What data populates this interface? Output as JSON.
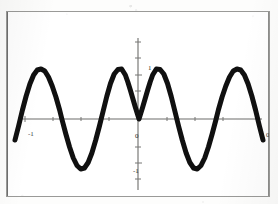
{
  "figure": {
    "kind": "scanned-plot",
    "background_color": "#fdfdfc",
    "frame_color": "#9a9a98",
    "curve_color": "#101010",
    "axis_color": "#6d6d6b"
  },
  "labels": {
    "y_positive": "1",
    "y_negative": "-1",
    "origin": "0",
    "x_left": "-1",
    "x_right": "0"
  },
  "chart_data": {
    "type": "line",
    "title": "",
    "subtitle": "",
    "xlabel": "",
    "ylabel": "",
    "xlim": [
      -1,
      1
    ],
    "ylim": [
      -1.35,
      1.35
    ],
    "grid": false,
    "legend": null,
    "axis_ticks": {
      "x": [
        -1,
        0,
        1
      ],
      "x_tick_labels": [
        "-1",
        "0",
        "0"
      ],
      "y": [
        -1,
        0,
        1
      ],
      "y_tick_labels": [
        "-1",
        "0",
        "1"
      ]
    },
    "line_width_px": 5,
    "line_style": "solid",
    "features": {
      "maxima_x": [
        -0.62,
        -0.14,
        0.15,
        0.62
      ],
      "maxima_y": [
        1,
        1,
        1,
        1
      ],
      "minima_x": [
        -0.37,
        0.39
      ],
      "minima_y": [
        -1,
        -1
      ],
      "cusp_x": 0,
      "cusp_y": 0,
      "zero_crossings_x": [
        -0.79,
        -0.46,
        -0.28,
        0,
        0.29,
        0.48,
        0.79
      ]
    },
    "series": [
      {
        "name": "curve",
        "x": [
          -1.0,
          -0.97,
          -0.94,
          -0.91,
          -0.88,
          -0.85,
          -0.82,
          -0.79,
          -0.76,
          -0.73,
          -0.7,
          -0.67,
          -0.64,
          -0.62,
          -0.59,
          -0.56,
          -0.53,
          -0.5,
          -0.47,
          -0.44,
          -0.41,
          -0.38,
          -0.35,
          -0.32,
          -0.29,
          -0.26,
          -0.23,
          -0.2,
          -0.17,
          -0.14,
          -0.11,
          -0.09,
          -0.07,
          -0.05,
          -0.03,
          -0.01,
          0.0,
          0.01,
          0.03,
          0.05,
          0.07,
          0.09,
          0.11,
          0.14,
          0.17,
          0.2,
          0.23,
          0.26,
          0.29,
          0.32,
          0.35,
          0.38,
          0.41,
          0.44,
          0.47,
          0.5,
          0.53,
          0.56,
          0.59,
          0.62,
          0.64,
          0.67,
          0.7,
          0.73,
          0.76,
          0.79,
          0.82,
          0.85,
          0.88,
          0.91,
          0.94,
          0.97,
          1.0
        ],
        "y": [
          -0.42,
          -0.13,
          0.18,
          0.46,
          0.7,
          0.88,
          0.98,
          1.0,
          0.96,
          0.84,
          0.66,
          0.44,
          0.18,
          -0.02,
          -0.3,
          -0.56,
          -0.78,
          -0.93,
          -1.0,
          -0.98,
          -0.87,
          -0.68,
          -0.43,
          -0.15,
          0.15,
          0.45,
          0.71,
          0.9,
          0.99,
          1.0,
          0.88,
          0.74,
          0.58,
          0.41,
          0.24,
          0.08,
          0.0,
          0.08,
          0.24,
          0.41,
          0.58,
          0.74,
          0.88,
          1.0,
          0.99,
          0.9,
          0.71,
          0.45,
          0.15,
          -0.15,
          -0.43,
          -0.68,
          -0.87,
          -0.98,
          -1.0,
          -0.93,
          -0.78,
          -0.56,
          -0.3,
          -0.02,
          0.18,
          0.44,
          0.66,
          0.84,
          0.96,
          1.0,
          0.98,
          0.88,
          0.7,
          0.46,
          0.18,
          -0.13,
          -0.42
        ]
      }
    ]
  }
}
